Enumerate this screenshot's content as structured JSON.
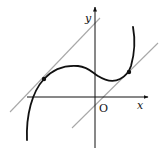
{
  "diagram": {
    "type": "function-graph",
    "labels": {
      "y_axis": "y",
      "x_axis": "x",
      "origin": "O"
    },
    "colors": {
      "curve": "#111111",
      "axes": "#111111",
      "tangent_lines": "#a8a8a8",
      "points": "#111111",
      "background": "#ffffff"
    },
    "tangent_points": [
      {
        "name": "left-tangent-point",
        "x": 44,
        "y": 79
      },
      {
        "name": "right-tangent-point",
        "x": 129,
        "y": 72
      }
    ],
    "tangent_lines": [
      {
        "name": "upper-tangent-line",
        "x1": 10,
        "y1": 112,
        "x2": 100,
        "y2": 18
      },
      {
        "name": "lower-tangent-line",
        "x1": 72,
        "y1": 128,
        "x2": 158,
        "y2": 43
      }
    ]
  }
}
